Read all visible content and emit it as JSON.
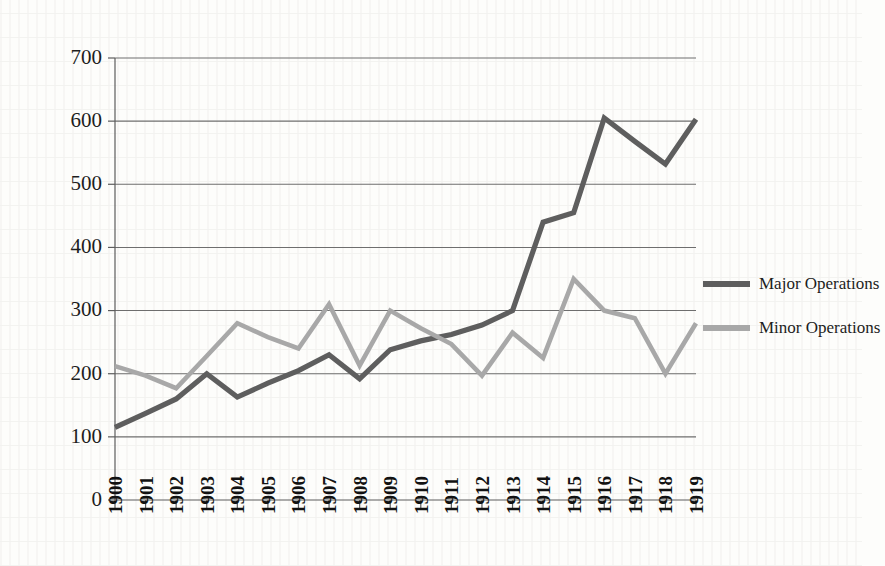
{
  "chart_data": {
    "type": "line",
    "title": "",
    "subtitle": "",
    "xlabel": "",
    "ylabel": "",
    "categories": [
      "1900",
      "1901",
      "1902",
      "1903",
      "1904",
      "1905",
      "1906",
      "1907",
      "1908",
      "1909",
      "1910",
      "1911",
      "1912",
      "1913",
      "1914",
      "1915",
      "1916",
      "1917",
      "1918",
      "1919"
    ],
    "series": [
      {
        "name": "Major Operations",
        "color": "#5e5e5e",
        "values": [
          115,
          137,
          160,
          200,
          163,
          185,
          205,
          230,
          192,
          238,
          252,
          262,
          277,
          300,
          440,
          455,
          605,
          568,
          532,
          603
        ]
      },
      {
        "name": "Minor Operations",
        "color": "#a8a8a8",
        "values": [
          212,
          197,
          177,
          228,
          280,
          258,
          240,
          310,
          213,
          300,
          272,
          247,
          197,
          265,
          225,
          350,
          300,
          288,
          200,
          280
        ]
      }
    ],
    "ylim": [
      0,
      700
    ],
    "y_ticks": [
      0,
      100,
      200,
      300,
      400,
      500,
      600,
      700
    ],
    "y_tick_labels": [
      "0",
      "100",
      "200",
      "300",
      "400",
      "500",
      "600",
      "700"
    ],
    "grid": true,
    "legend_position": "right"
  },
  "legend": {
    "entries": [
      {
        "label": "Major Operations",
        "color": "#5e5e5e"
      },
      {
        "label": "Minor Operations",
        "color": "#a8a8a8"
      }
    ]
  },
  "colors": {
    "major": "#5e5e5e",
    "minor": "#a8a8a8",
    "grid": "#6e6e6e",
    "axis": "#5d5d5d",
    "text": "#1d1d1d",
    "background": "#fdfdfb"
  }
}
